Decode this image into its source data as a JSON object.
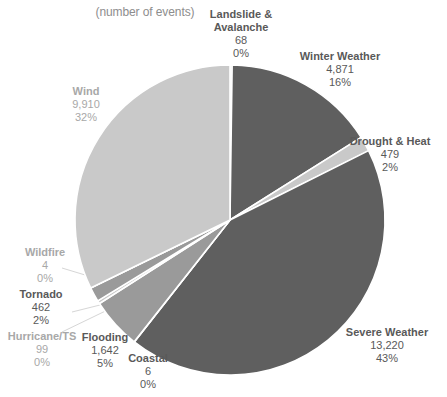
{
  "chart_data": {
    "type": "pie",
    "title": "Distribution of Hazard Events",
    "subtitle": "(number of events)",
    "xlabel": "",
    "ylabel": "",
    "legend_position": "none",
    "grid": false,
    "total_events": 30691,
    "categories": [
      "Landslide & Avalanche",
      "Winter Weather",
      "Drought & Heat",
      "Severe Weather",
      "Coastal",
      "Flooding",
      "Hurricane/TS",
      "Tornado",
      "Wildfire",
      "Wind"
    ],
    "values": [
      68,
      4871,
      479,
      13220,
      6,
      1642,
      99,
      462,
      4,
      9910
    ],
    "percent_labels": [
      "0%",
      "16%",
      "2%",
      "43%",
      "0%",
      "5%",
      "0%",
      "2%",
      "0%",
      "32%"
    ],
    "value_labels": [
      "68",
      "4,871",
      "479",
      "13,220",
      "6",
      "1,642",
      "99",
      "462",
      "4",
      "9,910"
    ],
    "slices": [
      {
        "name_line1": "Landslide &",
        "name_line2": "Avalanche",
        "value": "68",
        "percent": "0%",
        "color": "#c9c9c9",
        "tone": "tone-dark",
        "align": "align-center"
      },
      {
        "name_line1": "Winter Weather",
        "name_line2": "",
        "value": "4,871",
        "percent": "16%",
        "color": "#5f5f5f",
        "tone": "tone-dark",
        "align": "align-center"
      },
      {
        "name_line1": "Drought & Heat",
        "name_line2": "",
        "value": "479",
        "percent": "2%",
        "color": "#c9c9c9",
        "tone": "tone-dark",
        "align": "align-center"
      },
      {
        "name_line1": "Severe Weather",
        "name_line2": "",
        "value": "13,220",
        "percent": "43%",
        "color": "#5f5f5f",
        "tone": "tone-dark",
        "align": "align-center"
      },
      {
        "name_line1": "Coastal",
        "name_line2": "",
        "value": "6",
        "percent": "0%",
        "color": "#c9c9c9",
        "tone": "tone-dark",
        "align": "align-center"
      },
      {
        "name_line1": "Flooding",
        "name_line2": "",
        "value": "1,642",
        "percent": "5%",
        "color": "#9a9a9a",
        "tone": "tone-dark",
        "align": "align-center"
      },
      {
        "name_line1": "Hurricane/TS",
        "name_line2": "",
        "value": "99",
        "percent": "0%",
        "color": "#c9c9c9",
        "tone": "tone-light",
        "align": "align-center"
      },
      {
        "name_line1": "Tornado",
        "name_line2": "",
        "value": "462",
        "percent": "2%",
        "color": "#9a9a9a",
        "tone": "tone-dark",
        "align": "align-center"
      },
      {
        "name_line1": "Wildfire",
        "name_line2": "",
        "value": "4",
        "percent": "0%",
        "color": "#c9c9c9",
        "tone": "tone-light",
        "align": "align-center"
      },
      {
        "name_line1": "Wind",
        "name_line2": "",
        "value": "9,910",
        "percent": "32%",
        "color": "#c9c9c9",
        "tone": "tone-light",
        "align": "align-center"
      }
    ],
    "colors": {
      "dark_gray": "#5f5f5f",
      "mid_gray": "#9a9a9a",
      "light_gray": "#c9c9c9",
      "separator": "#ffffff",
      "label_dark": "#595959",
      "label_light": "#a8a8a8",
      "background": "#ffffff"
    }
  }
}
